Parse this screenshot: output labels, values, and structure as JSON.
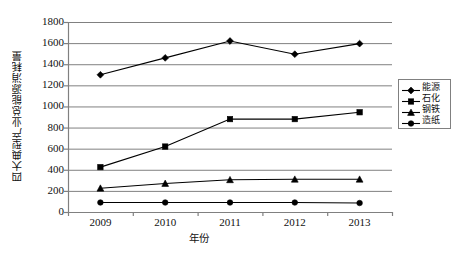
{
  "chart_data": {
    "type": "line",
    "title": "",
    "xlabel": "年份",
    "ylabel": "四大典型产业总能源消耗量",
    "categories": [
      "2009",
      "2010",
      "2011",
      "2012",
      "2013"
    ],
    "ylim": [
      0,
      1800
    ],
    "ytick_labels": [
      "0",
      "200",
      "400",
      "600",
      "800",
      "1000",
      "1200",
      "1400",
      "1600",
      "1800"
    ],
    "ytick_values": [
      0,
      200,
      400,
      600,
      800,
      1000,
      1200,
      1400,
      1600,
      1800
    ],
    "grid": true,
    "legend_position": "right",
    "series": [
      {
        "name": "能源",
        "marker": "diamond",
        "color": "#000000",
        "values": [
          1300,
          1460,
          1620,
          1495,
          1595
        ]
      },
      {
        "name": "石化",
        "marker": "square",
        "color": "#000000",
        "values": [
          425,
          620,
          880,
          880,
          945
        ]
      },
      {
        "name": "钢铁",
        "marker": "triangle",
        "color": "#000000",
        "values": [
          225,
          270,
          305,
          310,
          310
        ]
      },
      {
        "name": "造纸",
        "marker": "circle",
        "color": "#000000",
        "values": [
          90,
          90,
          90,
          90,
          85
        ]
      }
    ]
  },
  "axes": {
    "background": "#ffffff",
    "gridline_color": "#808080",
    "axis_color": "#808080"
  }
}
